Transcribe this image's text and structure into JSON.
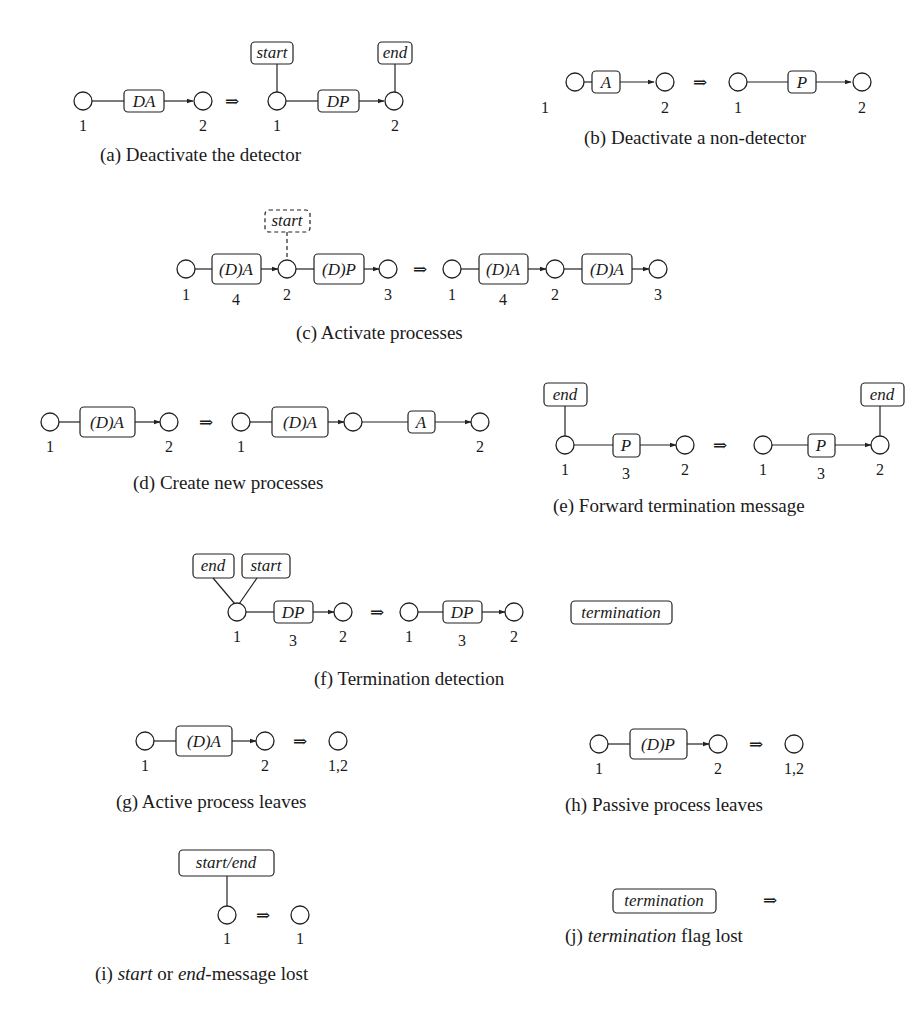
{
  "figure": {
    "panels": [
      {
        "id": "a",
        "caption": "(a) Deactivate the detector",
        "before": {
          "nodes": [
            "1",
            "2"
          ],
          "process": "DA"
        },
        "after": {
          "nodes": [
            "1",
            "2"
          ],
          "process": "DP",
          "messages": [
            "start",
            "end"
          ]
        }
      },
      {
        "id": "b",
        "caption": "(b) Deactivate a non-detector",
        "before": {
          "nodes": [
            "1",
            "2"
          ],
          "process": "A"
        },
        "after": {
          "nodes": [
            "1",
            "2"
          ],
          "process": "P"
        }
      },
      {
        "id": "c",
        "caption": "(c) Activate processes",
        "before": {
          "nodes": [
            "1",
            "2",
            "3"
          ],
          "processes": [
            "(D)A",
            "(D)P"
          ],
          "edge_label": "4",
          "messages": [
            "start"
          ]
        },
        "after": {
          "nodes": [
            "1",
            "2",
            "3"
          ],
          "processes": [
            "(D)A",
            "(D)A"
          ],
          "edge_label": "4"
        }
      },
      {
        "id": "d",
        "caption": "(d) Create new processes",
        "before": {
          "nodes": [
            "1",
            "2"
          ],
          "process": "(D)A"
        },
        "after": {
          "nodes": [
            "1",
            "",
            "2"
          ],
          "processes": [
            "(D)A",
            "A"
          ]
        }
      },
      {
        "id": "e",
        "caption": "(e) Forward termination message",
        "before": {
          "nodes": [
            "1",
            "2"
          ],
          "process": "P",
          "edge_label": "3",
          "messages": [
            "end"
          ]
        },
        "after": {
          "nodes": [
            "1",
            "2"
          ],
          "process": "P",
          "edge_label": "3",
          "messages": [
            "end"
          ]
        }
      },
      {
        "id": "f",
        "caption": "(f) Termination detection",
        "before": {
          "nodes": [
            "1",
            "2"
          ],
          "process": "DP",
          "edge_label": "3",
          "messages": [
            "end",
            "start"
          ]
        },
        "after": {
          "nodes": [
            "1",
            "2"
          ],
          "process": "DP",
          "edge_label": "3",
          "flag": "termination"
        }
      },
      {
        "id": "g",
        "caption": "(g) Active process leaves",
        "before": {
          "nodes": [
            "1",
            "2"
          ],
          "process": "(D)A"
        },
        "after": {
          "nodes": [
            "1,2"
          ]
        }
      },
      {
        "id": "h",
        "caption": "(h) Passive process leaves",
        "before": {
          "nodes": [
            "1",
            "2"
          ],
          "process": "(D)P"
        },
        "after": {
          "nodes": [
            "1,2"
          ]
        }
      },
      {
        "id": "i",
        "caption_parts": [
          "(i) ",
          "start",
          " or ",
          "end",
          "-message lost"
        ],
        "before": {
          "nodes": [
            "1"
          ],
          "messages": [
            "start/end"
          ]
        },
        "after": {
          "nodes": [
            "1"
          ]
        }
      },
      {
        "id": "j",
        "caption_parts": [
          "(j) ",
          "termination",
          " flag lost"
        ],
        "before": {
          "flag": "termination"
        },
        "after": {}
      }
    ],
    "transition_symbol": "⇒"
  }
}
